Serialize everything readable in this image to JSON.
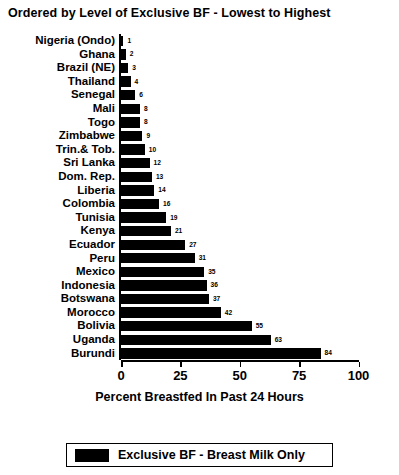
{
  "chart_data": {
    "type": "bar",
    "orientation": "horizontal",
    "title": "Ordered by Level of Exclusive BF - Lowest to Highest",
    "xlabel": "Percent Breastfed In Past 24 Hours",
    "ylabel": "",
    "xlim": [
      0,
      100
    ],
    "xticks": [
      0,
      25,
      50,
      75,
      100
    ],
    "xtick_labels": [
      "0",
      "25",
      "50",
      "75",
      "100"
    ],
    "grid": false,
    "legend_position": "bottom",
    "series": [
      {
        "name": "Exclusive BF - Breast Milk Only",
        "color": "#000000",
        "values": [
          1,
          2,
          3,
          4,
          6,
          8,
          8,
          9,
          10,
          12,
          13,
          14,
          16,
          19,
          21,
          27,
          31,
          35,
          36,
          37,
          42,
          55,
          63,
          84
        ]
      }
    ],
    "categories": [
      "Nigeria (Ondo)",
      "Ghana",
      "Brazil (NE)",
      "Thailand",
      "Senegal",
      "Mali",
      "Togo",
      "Zimbabwe",
      "Trin.& Tob.",
      "Sri Lanka",
      "Dom. Rep.",
      "Liberia",
      "Colombia",
      "Tunisia",
      "Kenya",
      "Ecuador",
      "Peru",
      "Mexico",
      "Indonesia",
      "Botswana",
      "Morocco",
      "Bolivia",
      "Uganda",
      "Burundi"
    ],
    "data_labels": [
      "1",
      "2",
      "3",
      "4",
      "6",
      "8",
      "8",
      "9",
      "10",
      "12",
      "13",
      "14",
      "16",
      "19",
      "21",
      "27",
      "31",
      "35",
      "36",
      "37",
      "42",
      "55",
      "63",
      "84"
    ]
  },
  "legend": {
    "items": [
      {
        "label": "Exclusive BF - Breast Milk Only",
        "color": "#000000"
      }
    ]
  }
}
